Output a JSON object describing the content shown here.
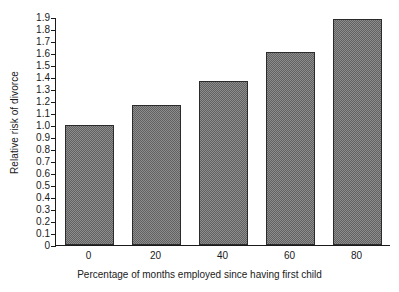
{
  "chart_data": {
    "type": "bar",
    "title": "",
    "subtitle": "",
    "xlabel": "Percentage of months employed since having first child",
    "ylabel": "Relative risk of divorce",
    "categories": [
      "0",
      "20",
      "40",
      "60",
      "80"
    ],
    "values": [
      1.0,
      1.17,
      1.37,
      1.61,
      1.88
    ],
    "series": [
      {
        "name": "Relative risk of divorce",
        "values": [
          1.0,
          1.17,
          1.37,
          1.61,
          1.88
        ]
      }
    ],
    "ylim": [
      0,
      1.9
    ],
    "xlim": [
      0,
      5
    ],
    "ytick_labels": [
      "0",
      "0.1",
      "0.2",
      "0.3",
      "0.4",
      "0.5",
      "0.6",
      "0.7",
      "0.8",
      "0.9",
      "1.0",
      "1.1",
      "1.2",
      "1.3",
      "1.4",
      "1.5",
      "1.6",
      "1.7",
      "1.8",
      "1.9"
    ],
    "ytick_values": [
      0,
      0.1,
      0.2,
      0.3,
      0.4,
      0.5,
      0.6,
      0.7,
      0.8,
      0.9,
      1.0,
      1.1,
      1.2,
      1.3,
      1.4,
      1.5,
      1.6,
      1.7,
      1.8,
      1.9
    ],
    "xtick_labels": [
      "0",
      "20",
      "40",
      "60",
      "80"
    ],
    "grid": false,
    "legend": false,
    "legend_position": "none",
    "bar_fill_color": "#8d8d8d",
    "bar_edge_color": "#2b2b2b",
    "axis_color": "#1a1a1a",
    "background_color": "#ffffff",
    "annotations": []
  }
}
